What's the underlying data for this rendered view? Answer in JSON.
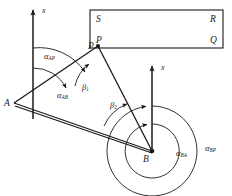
{
  "figure": {
    "type": "geodetic-triangulation-bearing-diagram",
    "background": "#ffffff",
    "ink_color": "#1a1a1a",
    "width": 232,
    "height": 196
  },
  "axes": [
    {
      "name": "x-axis-at-A",
      "label": "x",
      "orientation": "vertical-up",
      "origin_point": "A"
    },
    {
      "name": "x-axis-at-B",
      "label": "x",
      "orientation": "vertical-up",
      "origin_point": "B"
    }
  ],
  "points": [
    {
      "id": "A",
      "label": "A",
      "x": 14,
      "y": 103
    },
    {
      "id": "P",
      "label": "P",
      "x": 98,
      "y": 46
    },
    {
      "id": "B",
      "label": "B",
      "x": 152,
      "y": 151
    }
  ],
  "rectangle": {
    "name": "frame-rectangle",
    "corners": [
      {
        "id": "S",
        "label": "S",
        "position": "top-left"
      },
      {
        "id": "R",
        "label": "R",
        "position": "top-right"
      },
      {
        "id": "P",
        "label": "P",
        "position": "bottom-left"
      },
      {
        "id": "Q",
        "label": "Q",
        "position": "bottom-right"
      }
    ]
  },
  "angles": {
    "bearings": [
      {
        "name": "alpha-AP",
        "symbol": "α",
        "subscript": "AP",
        "at_point": "A",
        "arc": "outer"
      },
      {
        "name": "alpha-AB",
        "symbol": "α",
        "subscript": "AB",
        "at_point": "A",
        "arc": "inner"
      },
      {
        "name": "alpha-BA",
        "symbol": "α",
        "subscript": "BA",
        "at_point": "B",
        "arc": "inner"
      },
      {
        "name": "alpha-BP",
        "symbol": "α",
        "subscript": "BP",
        "at_point": "B",
        "arc": "outer"
      }
    ],
    "interior": [
      {
        "name": "beta-1",
        "symbol": "β",
        "subscript": "1",
        "at_point": "P",
        "vertex_label": "β"
      },
      {
        "name": "beta-2",
        "symbol": "β",
        "subscript": "2",
        "at_point": "B",
        "vertex_label": "β"
      }
    ]
  },
  "lines": [
    {
      "name": "line-A-P",
      "from": "A",
      "to": "P"
    },
    {
      "name": "line-P-B",
      "from": "P",
      "to": "B"
    },
    {
      "name": "line-A-B",
      "from": "A",
      "to": "B",
      "style": "double-stroke-baseline"
    }
  ]
}
